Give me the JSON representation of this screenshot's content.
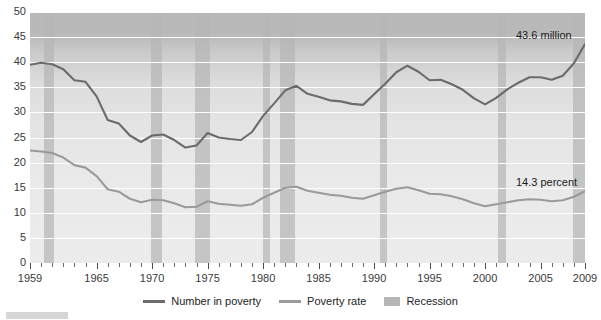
{
  "chart_data": {
    "type": "line",
    "title": "",
    "xlabel": "",
    "ylabel": "",
    "xlim": [
      1959,
      2009
    ],
    "ylim": [
      0,
      50
    ],
    "grid": true,
    "legend_position": "bottom-center",
    "x": [
      1959,
      1960,
      1961,
      1962,
      1963,
      1964,
      1965,
      1966,
      1967,
      1968,
      1969,
      1970,
      1971,
      1972,
      1973,
      1974,
      1975,
      1976,
      1977,
      1978,
      1979,
      1980,
      1981,
      1982,
      1983,
      1984,
      1985,
      1986,
      1987,
      1988,
      1989,
      1990,
      1991,
      1992,
      1993,
      1994,
      1995,
      1996,
      1997,
      1998,
      1999,
      2000,
      2001,
      2002,
      2003,
      2004,
      2005,
      2006,
      2007,
      2008,
      2009
    ],
    "series": [
      {
        "name": "Number in poverty",
        "units": "million",
        "color": "#6b6b6b",
        "values": [
          39.5,
          39.9,
          39.6,
          38.6,
          36.4,
          36.1,
          33.2,
          28.5,
          27.8,
          25.4,
          24.1,
          25.4,
          25.6,
          24.5,
          23.0,
          23.4,
          25.9,
          25.0,
          24.7,
          24.5,
          26.1,
          29.3,
          31.8,
          34.4,
          35.3,
          33.7,
          33.1,
          32.4,
          32.2,
          31.7,
          31.5,
          33.6,
          35.7,
          38.0,
          39.3,
          38.1,
          36.4,
          36.5,
          35.6,
          34.5,
          32.8,
          31.6,
          32.9,
          34.6,
          35.9,
          37.0,
          37.0,
          36.5,
          37.3,
          39.8,
          43.6
        ]
      },
      {
        "name": "Poverty rate",
        "units": "percent",
        "color": "#9a9a9a",
        "values": [
          22.4,
          22.2,
          21.9,
          21.0,
          19.5,
          19.0,
          17.3,
          14.7,
          14.2,
          12.8,
          12.1,
          12.6,
          12.5,
          11.9,
          11.1,
          11.2,
          12.3,
          11.8,
          11.6,
          11.4,
          11.7,
          13.0,
          14.0,
          15.0,
          15.2,
          14.4,
          14.0,
          13.6,
          13.4,
          13.0,
          12.8,
          13.5,
          14.2,
          14.8,
          15.1,
          14.5,
          13.8,
          13.7,
          13.3,
          12.7,
          11.9,
          11.3,
          11.7,
          12.1,
          12.5,
          12.7,
          12.6,
          12.3,
          12.5,
          13.2,
          14.3
        ]
      }
    ],
    "recessions": [
      {
        "start": 1960.3,
        "end": 1961.2
      },
      {
        "start": 1969.9,
        "end": 1970.9
      },
      {
        "start": 1973.9,
        "end": 1975.2
      },
      {
        "start": 1980.0,
        "end": 1980.6
      },
      {
        "start": 1981.5,
        "end": 1982.9
      },
      {
        "start": 1990.5,
        "end": 1991.2
      },
      {
        "start": 2001.2,
        "end": 2001.9
      },
      {
        "start": 2007.9,
        "end": 2009.5
      }
    ],
    "yticks": [
      0,
      5,
      10,
      15,
      20,
      25,
      30,
      35,
      40,
      45,
      50
    ],
    "xticks_major": [
      1959,
      1965,
      1970,
      1975,
      1980,
      1985,
      1990,
      1995,
      2000,
      2005,
      2009
    ],
    "annotations": [
      {
        "name": "number-in-poverty-end-label",
        "text": "43.6 million",
        "x": 2009,
        "y": 43.6
      },
      {
        "name": "poverty-rate-end-label",
        "text": "14.3 percent",
        "x": 2009,
        "y": 14.3
      }
    ]
  },
  "legend": {
    "items": [
      {
        "label": "Number in poverty",
        "type": "line",
        "color": "#6b6b6b"
      },
      {
        "label": "Poverty rate",
        "type": "line",
        "color": "#9a9a9a"
      },
      {
        "label": "Recession",
        "type": "band",
        "color": "#b6b6b6"
      }
    ]
  },
  "colors": {
    "plot_background": "#e8e8e8",
    "gridline": "#ffffff",
    "recession_band": "#b6b6b6",
    "number_line": "#6b6b6b",
    "rate_line": "#9a9a9a",
    "axis_text": "#3a3a3a"
  }
}
